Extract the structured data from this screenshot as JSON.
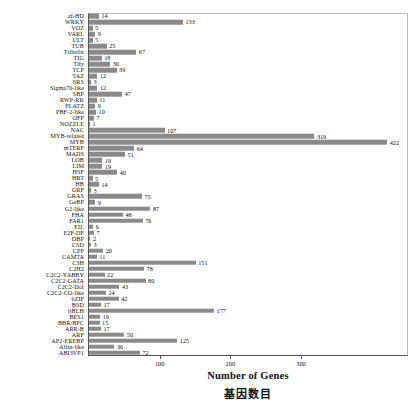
{
  "chart_data": {
    "type": "bar",
    "orientation": "horizontal",
    "title": "",
    "xlabel": "Number of Genes",
    "xlabel_zh": "基因数目",
    "ylabel": "",
    "xlim": [
      0,
      450
    ],
    "xticks": [
      100,
      200,
      300
    ],
    "grid": false,
    "legend": false,
    "bar_color": "#8a8a8a",
    "categories": [
      "zf-HD",
      "WRKY",
      "VOZ",
      "VARL",
      "ULT",
      "TUB",
      "Trihelix",
      "TIG",
      "Tify",
      "TCP",
      "TAZ",
      "SRS",
      "Sigma70-like",
      "SBP",
      "RWP-RK",
      "PLATZ",
      "PBF-2-like",
      "OFP",
      "NOZZLE",
      "NAC",
      "MYB-related",
      "MYB",
      "mTERF",
      "MADS",
      "LOB",
      "LIM",
      "HSF",
      "HRT",
      "HB",
      "GRF",
      "GRAS",
      "GeBP",
      "G2-like",
      "FHA",
      "FAR1",
      "EIL",
      "E2F-DP",
      "DBP",
      "CSD",
      "CPP",
      "CAMTA",
      "C3H",
      "C2H2",
      "C2C2-YABBY",
      "C2C2-GATA",
      "C2C2-Dof",
      "C2C2-CO-like",
      "bZIP",
      "BSD",
      "bHLH",
      "BES1",
      "BBR/BPC",
      "ARR-B",
      "ARF",
      "AP2-EREBP",
      "Alfin-like",
      "ABI3VP1"
    ],
    "values": [
      14,
      133,
      5,
      9,
      5,
      25,
      67,
      18,
      30,
      39,
      12,
      3,
      12,
      47,
      11,
      9,
      10,
      7,
      1,
      107,
      319,
      422,
      64,
      51,
      19,
      19,
      40,
      5,
      14,
      3,
      75,
      9,
      87,
      48,
      76,
      6,
      7,
      2,
      3,
      20,
      11,
      151,
      78,
      22,
      80,
      43,
      24,
      42,
      17,
      177,
      16,
      15,
      17,
      50,
      125,
      36,
      72
    ]
  }
}
